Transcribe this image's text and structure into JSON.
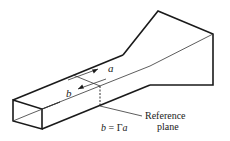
{
  "diagram": {
    "type": "waveguide-horn-reference-plane",
    "labels": {
      "incident_wave": "a",
      "reflected_wave": "b",
      "equation": "b = Γa",
      "reference_plane_line1": "Reference",
      "reference_plane_line2": "plane"
    },
    "colors": {
      "line": "#1a1a1a",
      "background": "#ffffff"
    }
  }
}
